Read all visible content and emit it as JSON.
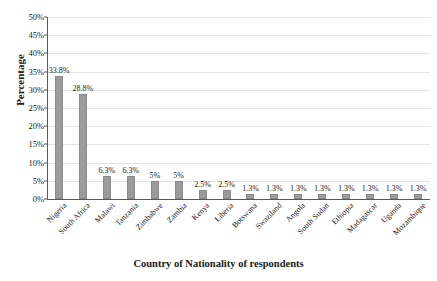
{
  "chart_data": {
    "type": "bar",
    "title": "",
    "xlabel": "Country of Nationality of respondents",
    "ylabel": "Percentage",
    "ylim": [
      0,
      50
    ],
    "ytick_step": 5,
    "grid": true,
    "legend": false,
    "bar_color": "#9b9b9b",
    "categories": [
      "Nigeria",
      "South Africa",
      "Malawi",
      "Tanzania",
      "Zimbabwe",
      "Zambia",
      "Kenya",
      "Liberia",
      "Botswana",
      "Swaziland",
      "Angola",
      "South Sudan",
      "Ethiopia",
      "Madagascar",
      "Uganda",
      "Mozambique"
    ],
    "values": [
      33.8,
      28.8,
      6.3,
      6.3,
      5,
      5,
      2.5,
      2.5,
      1.3,
      1.3,
      1.3,
      1.3,
      1.3,
      1.3,
      1.3,
      1.3
    ],
    "data_labels": [
      "33.8%",
      "28.8%",
      "6.3%",
      "6.3%",
      "5%",
      "5%",
      "2.5%",
      "2.5%",
      "1.3%",
      "1.3%",
      "1.3%",
      "1.3%",
      "1.3%",
      "1.3%",
      "1.3%",
      "1.3%"
    ],
    "ytick_labels": [
      "0%",
      "5%",
      "10%",
      "15%",
      "20%",
      "25%",
      "30%",
      "35%",
      "40%",
      "45%",
      "50%"
    ],
    "ytick_values": [
      0,
      5,
      10,
      15,
      20,
      25,
      30,
      35,
      40,
      45,
      50
    ]
  }
}
